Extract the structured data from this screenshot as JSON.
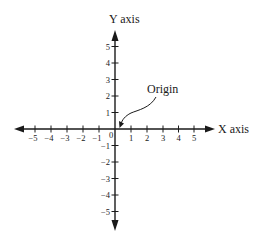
{
  "diagram": {
    "x_axis": {
      "label": "X axis",
      "ticks": [
        {
          "value": -5,
          "label": "−5"
        },
        {
          "value": -4,
          "label": "−4"
        },
        {
          "value": -3,
          "label": "−3"
        },
        {
          "value": -2,
          "label": "−2"
        },
        {
          "value": -1,
          "label": "−1"
        },
        {
          "value": 1,
          "label": "1"
        },
        {
          "value": 2,
          "label": "2"
        },
        {
          "value": 3,
          "label": "3"
        },
        {
          "value": 4,
          "label": "4"
        },
        {
          "value": 5,
          "label": "5"
        }
      ]
    },
    "y_axis": {
      "label": "Y axis",
      "ticks": [
        {
          "value": 5,
          "label": "5"
        },
        {
          "value": 4,
          "label": "4"
        },
        {
          "value": 3,
          "label": "3"
        },
        {
          "value": 2,
          "label": "2"
        },
        {
          "value": 1,
          "label": "1"
        },
        {
          "value": -1,
          "label": "−1"
        },
        {
          "value": -2,
          "label": "−2"
        },
        {
          "value": -3,
          "label": "−3"
        },
        {
          "value": -4,
          "label": "−4"
        },
        {
          "value": -5,
          "label": "−5"
        }
      ]
    },
    "origin_label": "0",
    "annotation": {
      "text": "Origin",
      "points_to": "origin"
    },
    "colors": {
      "stroke": "#1a1a1a",
      "background": "#ffffff"
    }
  }
}
